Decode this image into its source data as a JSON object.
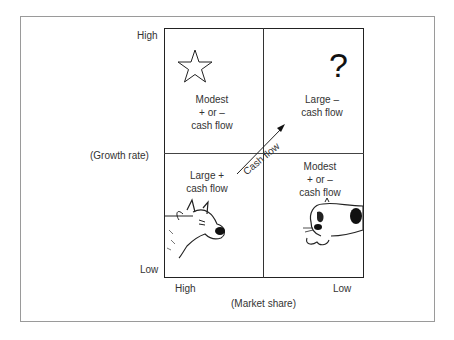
{
  "axes": {
    "y_high": "High",
    "y_low": "Low",
    "y_title": "(Growth rate)",
    "x_high": "High",
    "x_low": "Low",
    "x_title": "(Market share)"
  },
  "quadrants": {
    "top_left": {
      "icon": "star-icon",
      "line1": "Modest",
      "line2": "+ or –",
      "line3": "cash flow"
    },
    "top_right": {
      "icon": "question-mark-icon",
      "symbol": "?",
      "line1": "Large –",
      "line2": "cash flow"
    },
    "bottom_left": {
      "icon": "cow-icon",
      "line1": "Large +",
      "line2": "cash flow"
    },
    "bottom_right": {
      "icon": "dog-icon",
      "line1": "Modest",
      "line2": "+ or –",
      "line3": "cash flow"
    }
  },
  "arrow": {
    "label": "Cash flow"
  }
}
